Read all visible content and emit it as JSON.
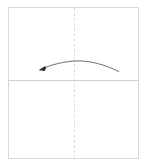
{
  "diagram": {
    "type": "origami-fold-step",
    "panel": {
      "name": "paper-square",
      "shape": "square",
      "fill_color": "#ffffff",
      "border_color": "#d8d8d8",
      "x": 8,
      "y": 7,
      "width": 131,
      "height": 152
    },
    "guides": [
      {
        "name": "horizontal-crease",
        "orientation": "horizontal",
        "style": "solid",
        "color": "#d0d0d0",
        "position_label": "center",
        "y": 80
      },
      {
        "name": "vertical-fold-line",
        "orientation": "vertical",
        "style": "dashed",
        "color": "#dcdcdc",
        "position_label": "center",
        "x": 74
      }
    ],
    "arrow": {
      "name": "fold-arrow",
      "icon": "curved-arrow-left-icon",
      "direction": "left",
      "curve": "arc-upward",
      "stroke_color": "#6e6e6e",
      "head_color": "#2b2b2b",
      "start_x": 118,
      "start_y": 71,
      "peak_x": 78,
      "peak_y": 61,
      "end_x": 41,
      "end_y": 69
    }
  }
}
